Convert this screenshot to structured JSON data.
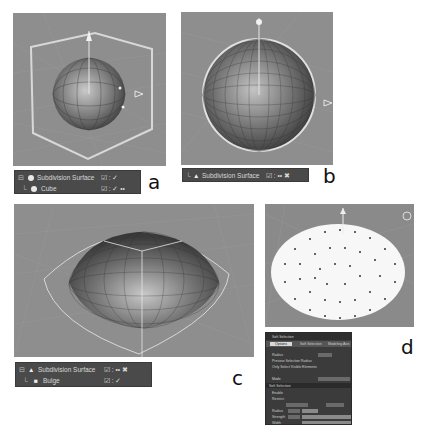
{
  "panels": {
    "a": {
      "label": "a",
      "object_manager": [
        {
          "name": "Subdivision Surface",
          "icon": "subdivision-icon",
          "flags": "☑ : ✓"
        },
        {
          "name": "Cube",
          "icon": "cube-icon",
          "flags": "☑ : ✓ ••"
        }
      ]
    },
    "b": {
      "label": "b",
      "object_manager": [
        {
          "name": "Subdivision Surface",
          "icon": "subdivision-icon",
          "flags": "☑ :  •• ✖"
        }
      ]
    },
    "c": {
      "label": "c",
      "object_manager": [
        {
          "name": "Subdivision Surface",
          "icon": "subdivision-icon",
          "flags": "☑ :  •• ✖"
        },
        {
          "name": "Bulge",
          "icon": "bulge-icon",
          "flags": "☑ : ✓"
        }
      ]
    },
    "d": {
      "label": "d",
      "attribute_manager": {
        "title": "Soft Selection",
        "tabs": [
          "Options",
          "Soft Selection",
          "Modeling Axis"
        ],
        "rows": [
          "Radius",
          "Preview Selection Radius",
          "Only Select Visible Elements",
          "Mode"
        ],
        "section2": "Soft Selection",
        "rows2": [
          "Enable",
          "Restrict",
          "Radius",
          "Strength",
          "Width"
        ]
      }
    }
  }
}
